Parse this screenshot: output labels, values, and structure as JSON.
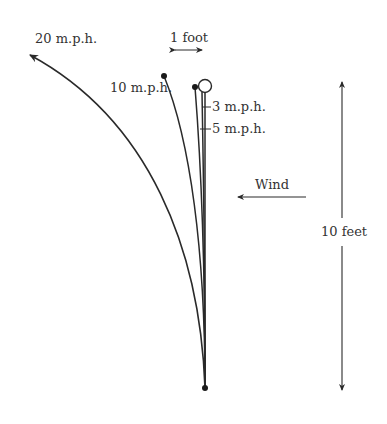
{
  "diagram": {
    "labels": {
      "mph20": "20 m.p.h.",
      "mph10": "10 m.p.h.",
      "mph3": "3 m.p.h.",
      "mph5": "5 m.p.h.",
      "scale": "1 foot",
      "wind": "Wind",
      "height": "10 feet"
    },
    "colors": {
      "line": "#2a2a2a",
      "text": "#333333",
      "background": "#ffffff"
    }
  }
}
